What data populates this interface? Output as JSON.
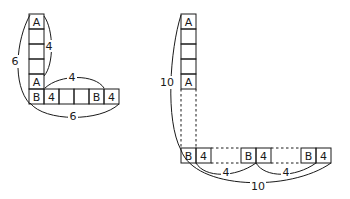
{
  "left_figure": {
    "column_cells": [
      "A",
      "",
      "",
      "",
      "A"
    ],
    "row_cells": [
      "B",
      "4",
      "",
      "",
      "B",
      "4"
    ],
    "dimensions": {
      "column_inner_span": "4",
      "column_total_span": "6",
      "row_inner_span": "4",
      "row_total_span": "6"
    }
  },
  "right_figure": {
    "column_cells": [
      "A",
      "",
      "",
      "",
      "A"
    ],
    "row_groups": [
      {
        "cells": [
          "B",
          "4"
        ]
      },
      {
        "cells": [
          "B",
          "4"
        ]
      },
      {
        "cells": [
          "B",
          "4"
        ]
      }
    ],
    "dimensions": {
      "column_total_span": "10",
      "gap_1": "4",
      "gap_2": "4",
      "row_total_span": "10"
    }
  }
}
